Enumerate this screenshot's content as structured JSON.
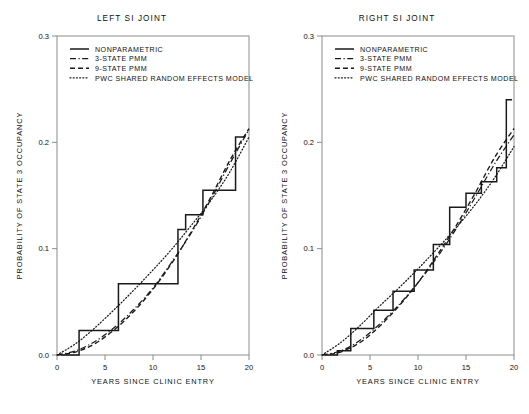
{
  "figure": {
    "panels": [
      {
        "key": "left",
        "title": "LEFT SI JOINT",
        "xlabel": "YEARS SINCE CLINIC ENTRY",
        "ylabel": "PROBABILITY OF STATE 3 OCCUPANCY"
      },
      {
        "key": "right",
        "title": "RIGHT SI JOINT",
        "xlabel": "YEARS SINCE CLINIC ENTRY",
        "ylabel": "PROBABILITY OF STATE 3 OCCUPANCY"
      }
    ],
    "legend": [
      {
        "label": "NONPARAMETRIC",
        "style": "solid"
      },
      {
        "label": "3-STATE PMM",
        "style": "dash-dot"
      },
      {
        "label": "9-STATE PMM",
        "style": "dashed"
      },
      {
        "label": "PWC SHARED RANDOM EFFECTS MODEL",
        "style": "dotted"
      }
    ],
    "xticks": [
      "0",
      "5",
      "10",
      "15",
      "20"
    ],
    "yticks": [
      "0.0",
      "0.1",
      "0.2",
      "0.3"
    ]
  },
  "chart_data": [
    {
      "type": "line",
      "title": "LEFT SI JOINT",
      "xlabel": "YEARS SINCE CLINIC ENTRY",
      "ylabel": "PROBABILITY OF STATE 3 OCCUPANCY",
      "xlim": [
        0,
        20
      ],
      "ylim": [
        0.0,
        0.3
      ],
      "xticks": [
        0,
        5,
        10,
        15,
        20
      ],
      "yticks": [
        0.0,
        0.1,
        0.2,
        0.3
      ],
      "grid": false,
      "legend_position": "top-left",
      "series": [
        {
          "name": "NONPARAMETRIC",
          "style": "solid",
          "kind": "step",
          "x": [
            0.4,
            2.3,
            2.3,
            6.4,
            6.4,
            9.3,
            9.3,
            12.6,
            12.6,
            13.4,
            13.4,
            15.2,
            15.2,
            17.0,
            17.0,
            18.6,
            18.6,
            19.6
          ],
          "y": [
            0.0,
            0.0,
            0.023,
            0.023,
            0.067,
            0.067,
            0.067,
            0.067,
            0.118,
            0.118,
            0.132,
            0.132,
            0.155,
            0.155,
            0.155,
            0.155,
            0.205,
            0.205
          ]
        },
        {
          "name": "3-STATE PMM",
          "style": "dash-dot",
          "kind": "smooth",
          "x": [
            0,
            2,
            4,
            6,
            8,
            10,
            12,
            14,
            16,
            18,
            20
          ],
          "y": [
            0.0,
            0.004,
            0.013,
            0.026,
            0.043,
            0.063,
            0.088,
            0.115,
            0.146,
            0.18,
            0.212
          ]
        },
        {
          "name": "9-STATE PMM",
          "style": "dashed",
          "kind": "smooth",
          "x": [
            0,
            2,
            4,
            6,
            8,
            10,
            12,
            14,
            16,
            18,
            20
          ],
          "y": [
            0.0,
            0.003,
            0.011,
            0.024,
            0.041,
            0.062,
            0.087,
            0.116,
            0.148,
            0.183,
            0.213
          ]
        },
        {
          "name": "PWC SHARED RANDOM EFFECTS MODEL",
          "style": "dotted",
          "kind": "smooth",
          "x": [
            0,
            2,
            4,
            6,
            8,
            10,
            12,
            14,
            16,
            18,
            20
          ],
          "y": [
            0.0,
            0.011,
            0.026,
            0.043,
            0.061,
            0.08,
            0.1,
            0.122,
            0.145,
            0.172,
            0.205
          ]
        }
      ]
    },
    {
      "type": "line",
      "title": "RIGHT SI JOINT",
      "xlabel": "YEARS SINCE CLINIC ENTRY",
      "ylabel": "PROBABILITY OF STATE 3 OCCUPANCY",
      "xlim": [
        0,
        20
      ],
      "ylim": [
        0.0,
        0.3
      ],
      "xticks": [
        0,
        5,
        10,
        15,
        20
      ],
      "yticks": [
        0.0,
        0.1,
        0.2,
        0.3
      ],
      "grid": false,
      "legend_position": "top-left",
      "series": [
        {
          "name": "NONPARAMETRIC",
          "style": "solid",
          "kind": "step",
          "x": [
            0.3,
            1.6,
            1.6,
            3.0,
            3.0,
            5.4,
            5.4,
            7.4,
            7.4,
            9.6,
            9.6,
            11.6,
            11.6,
            13.3,
            13.3,
            15.0,
            15.0,
            16.6,
            16.6,
            18.2,
            18.2,
            19.2,
            19.2,
            19.8
          ],
          "y": [
            0.0,
            0.0,
            0.004,
            0.004,
            0.025,
            0.025,
            0.042,
            0.042,
            0.06,
            0.06,
            0.08,
            0.08,
            0.104,
            0.104,
            0.139,
            0.139,
            0.152,
            0.152,
            0.163,
            0.163,
            0.176,
            0.176,
            0.24,
            0.24
          ]
        },
        {
          "name": "3-STATE PMM",
          "style": "dash-dot",
          "kind": "smooth",
          "x": [
            0,
            2,
            4,
            6,
            8,
            10,
            12,
            14,
            16,
            18,
            20
          ],
          "y": [
            0.0,
            0.004,
            0.014,
            0.029,
            0.047,
            0.068,
            0.092,
            0.119,
            0.149,
            0.18,
            0.207
          ]
        },
        {
          "name": "9-STATE PMM",
          "style": "dashed",
          "kind": "smooth",
          "x": [
            0,
            2,
            4,
            6,
            8,
            10,
            12,
            14,
            16,
            18,
            20
          ],
          "y": [
            0.0,
            0.003,
            0.012,
            0.027,
            0.046,
            0.068,
            0.094,
            0.122,
            0.153,
            0.186,
            0.213
          ]
        },
        {
          "name": "PWC SHARED RANDOM EFFECTS MODEL",
          "style": "dotted",
          "kind": "smooth",
          "x": [
            0,
            2,
            4,
            6,
            8,
            10,
            12,
            14,
            16,
            18,
            20
          ],
          "y": [
            0.0,
            0.012,
            0.028,
            0.046,
            0.063,
            0.081,
            0.1,
            0.12,
            0.142,
            0.167,
            0.196
          ]
        }
      ]
    }
  ]
}
